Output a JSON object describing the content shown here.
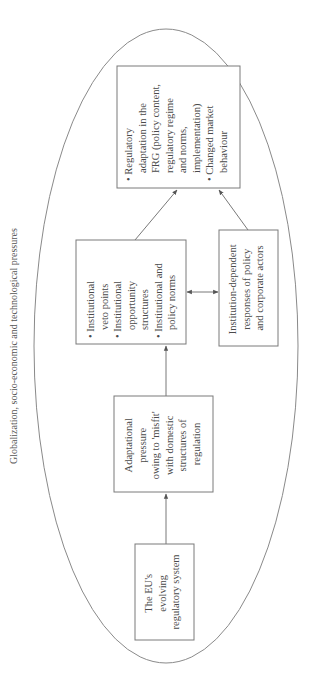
{
  "diagram": {
    "outer_label": "Globalization, socio-economic and technological pressures",
    "nodes": {
      "eu_system": {
        "lines": [
          "The EU's",
          "evolving",
          "regulatory system"
        ]
      },
      "adaptational_pressure": {
        "lines": [
          "Adaptational",
          "pressure",
          "owing to 'misfit'",
          "with domestic",
          "structures of",
          "regulation"
        ]
      },
      "institutional": {
        "lines": [
          "• Institutional",
          "veto points",
          "• Institutional",
          "opportunity",
          "structures",
          "• Institutional and",
          "policy norms"
        ]
      },
      "actor_responses": {
        "lines": [
          "Institution-dependent",
          "responses of policy",
          "and corporate actors"
        ]
      },
      "regulatory_adaptation": {
        "lines": [
          "• Regulatory",
          "adaptation in the",
          "FRG (policy content,",
          "regulatory regime",
          "and norms,",
          "implementation)",
          "• Changed market",
          "behaviour"
        ]
      }
    },
    "edges": [
      {
        "from": "eu_system",
        "to": "adaptational_pressure",
        "type": "arrow"
      },
      {
        "from": "adaptational_pressure",
        "to": "institutional",
        "type": "arrow"
      },
      {
        "from": "institutional",
        "to": "actor_responses",
        "type": "double-arrow"
      },
      {
        "from": "institutional",
        "to": "regulatory_adaptation",
        "type": "arrow"
      },
      {
        "from": "actor_responses",
        "to": "regulatory_adaptation",
        "type": "arrow"
      }
    ]
  }
}
